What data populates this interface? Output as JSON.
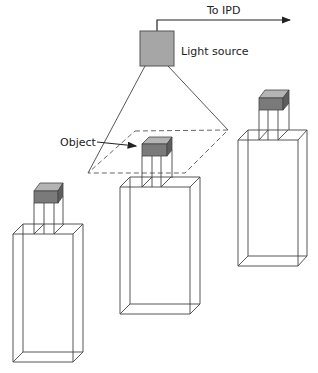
{
  "diagram": {
    "labels": {
      "to_ipd": "To IPD",
      "light_source": "Light source",
      "object": "Object"
    },
    "colors": {
      "light_source_fill": "#a6a6a6",
      "object_front": "#7a7a7a",
      "object_top": "#b4b4b4",
      "object_side": "#5e5e5e",
      "line": "#444444"
    },
    "containers": [
      {
        "id": "left",
        "position": "bottom-left"
      },
      {
        "id": "center",
        "position": "center"
      },
      {
        "id": "right",
        "position": "top-right"
      }
    ]
  }
}
